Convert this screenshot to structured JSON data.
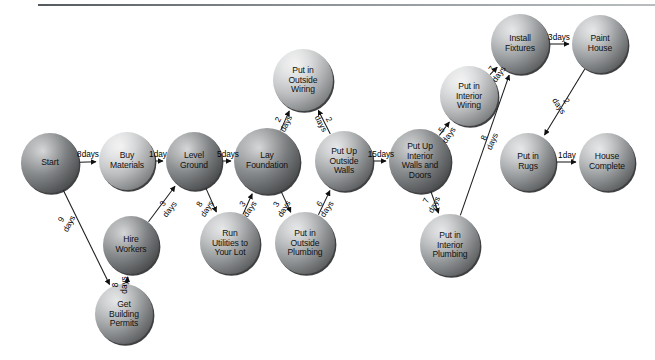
{
  "diagram": {
    "type": "directed-graph",
    "background_color": "#ffffff",
    "node_label_color": "#111111",
    "edge_color": "#1a1a1a",
    "nodes": [
      {
        "id": "start",
        "label": "Start",
        "cx": 50,
        "cy": 163,
        "rx": 29,
        "ry": 30,
        "shade": "dark"
      },
      {
        "id": "buy_materials",
        "label": "Buy\nMaterials",
        "cx": 127,
        "cy": 161,
        "rx": 28,
        "ry": 29,
        "shade": "light"
      },
      {
        "id": "level_ground",
        "label": "Level\nGround",
        "cx": 194,
        "cy": 161,
        "rx": 28,
        "ry": 29,
        "shade": "dark"
      },
      {
        "id": "lay_foundation",
        "label": "Lay\nFoundation",
        "cx": 267,
        "cy": 161,
        "rx": 33,
        "ry": 33,
        "shade": "dark"
      },
      {
        "id": "outside_wiring",
        "label": "Put in\nOutside\nWiring",
        "cx": 303,
        "cy": 80,
        "rx": 30,
        "ry": 31,
        "shade": "light"
      },
      {
        "id": "outside_walls",
        "label": "Put Up\nOutside\nWalls",
        "cx": 344,
        "cy": 161,
        "rx": 29,
        "ry": 30,
        "shade": "mid"
      },
      {
        "id": "run_utilities",
        "label": "Run\nUtilities to\nYour Lot",
        "cx": 230,
        "cy": 243,
        "rx": 30,
        "ry": 31,
        "shade": "mid"
      },
      {
        "id": "outside_plumbing",
        "label": "Put in\nOutside\nPlumbing",
        "cx": 305,
        "cy": 243,
        "rx": 30,
        "ry": 31,
        "shade": "mid"
      },
      {
        "id": "interior_walls",
        "label": "Put Up\nInterior\nWalls and\nDoors",
        "cx": 420,
        "cy": 161,
        "rx": 31,
        "ry": 32,
        "shade": "dark"
      },
      {
        "id": "interior_wiring",
        "label": "Put in\nInterior\nWiring",
        "cx": 469,
        "cy": 96,
        "rx": 29,
        "ry": 30,
        "shade": "light"
      },
      {
        "id": "interior_plumbing",
        "label": "Put in\nInterior\nPlumbing",
        "cx": 450,
        "cy": 245,
        "rx": 30,
        "ry": 31,
        "shade": "mid"
      },
      {
        "id": "install_fixtures",
        "label": "Install\nFixtures",
        "cx": 520,
        "cy": 44,
        "rx": 29,
        "ry": 30,
        "shade": "mid"
      },
      {
        "id": "paint_house",
        "label": "Paint\nHouse",
        "cx": 600,
        "cy": 44,
        "rx": 28,
        "ry": 29,
        "shade": "mid"
      },
      {
        "id": "put_in_rugs",
        "label": "Put in\nRugs",
        "cx": 528,
        "cy": 162,
        "rx": 28,
        "ry": 29,
        "shade": "mid"
      },
      {
        "id": "house_complete",
        "label": "House\nComplete",
        "cx": 607,
        "cy": 162,
        "rx": 28,
        "ry": 29,
        "shade": "mid"
      }
    ],
    "edges": [
      {
        "id": "e1",
        "from": "start",
        "to": "buy_materials",
        "days": "8",
        "unit": "days",
        "label_x": 88,
        "label_y": 155,
        "rotate": 0,
        "stacked": true
      },
      {
        "id": "e2",
        "from": "buy_materials",
        "to": "level_ground",
        "days": "1",
        "unit": "day",
        "label_x": 158,
        "label_y": 155,
        "rotate": 0,
        "stacked": true
      },
      {
        "id": "e3",
        "from": "level_ground",
        "to": "lay_foundation",
        "days": "5",
        "unit": "days",
        "label_x": 228,
        "label_y": 155,
        "rotate": 0,
        "stacked": true
      },
      {
        "id": "e4",
        "from": "start",
        "to": "get_permits",
        "days": "9",
        "unit": "days",
        "label_x": 66,
        "label_y": 222,
        "rotate": -62,
        "stacked": true
      },
      {
        "id": "e5",
        "from": "get_permits",
        "to": "hire_workers",
        "days": "8",
        "unit": "days",
        "label_x": 121,
        "label_y": 285,
        "rotate": -90,
        "stacked": true
      },
      {
        "id": "e6",
        "from": "hire_workers",
        "to": "level_ground",
        "days": "3",
        "unit": "days",
        "label_x": 167,
        "label_y": 207,
        "rotate": -52,
        "stacked": true
      },
      {
        "id": "e7",
        "from": "level_ground",
        "to": "run_utilities",
        "days": "8",
        "unit": "days",
        "label_x": 204,
        "label_y": 207,
        "rotate": -58,
        "stacked": true
      },
      {
        "id": "e8",
        "from": "run_utilities",
        "to": "lay_foundation",
        "days": "3",
        "unit": "days",
        "label_x": 247,
        "label_y": 207,
        "rotate": -56,
        "stacked": true
      },
      {
        "id": "e9",
        "from": "lay_foundation",
        "to": "outside_plumbing",
        "days": "3",
        "unit": "days",
        "label_x": 281,
        "label_y": 207,
        "rotate": -60,
        "stacked": true
      },
      {
        "id": "e10",
        "from": "outside_plumbing",
        "to": "outside_walls",
        "days": "6",
        "unit": "days",
        "label_x": 324,
        "label_y": 207,
        "rotate": -56,
        "stacked": true
      },
      {
        "id": "e11",
        "from": "lay_foundation",
        "to": "outside_wiring",
        "days": "2",
        "unit": "days",
        "label_x": 283,
        "label_y": 122,
        "rotate": -64,
        "stacked": true
      },
      {
        "id": "e12",
        "from": "outside_walls",
        "to": "outside_wiring",
        "days": "2",
        "unit": "days",
        "label_x": 324,
        "label_y": 122,
        "rotate": 62,
        "stacked": true
      },
      {
        "id": "e13",
        "from": "outside_walls",
        "to": "interior_walls",
        "days": "15",
        "unit": "days",
        "label_x": 381,
        "label_y": 155,
        "rotate": 0,
        "stacked": true
      },
      {
        "id": "e14",
        "from": "interior_walls",
        "to": "interior_wiring",
        "days": "5",
        "unit": "days",
        "label_x": 446,
        "label_y": 133,
        "rotate": -56,
        "stacked": true
      },
      {
        "id": "e15",
        "from": "interior_wiring",
        "to": "install_fixtures",
        "days": "7",
        "unit": "days",
        "label_x": 496,
        "label_y": 72,
        "rotate": -54,
        "stacked": true
      },
      {
        "id": "e16",
        "from": "interior_walls",
        "to": "interior_plumbing",
        "days": "7",
        "unit": "days",
        "label_x": 431,
        "label_y": 203,
        "rotate": -64,
        "stacked": true
      },
      {
        "id": "e17",
        "from": "interior_plumbing",
        "to": "install_fixtures",
        "days": "8",
        "unit": "days",
        "label_x": 489,
        "label_y": 140,
        "rotate": -66,
        "stacked": true
      },
      {
        "id": "e18",
        "from": "install_fixtures",
        "to": "paint_house",
        "days": "3",
        "unit": "days",
        "label_x": 559,
        "label_y": 38,
        "rotate": 0,
        "stacked": true
      },
      {
        "id": "e19",
        "from": "paint_house",
        "to": "put_in_rugs",
        "days": "2",
        "unit": "days",
        "label_x": 562,
        "label_y": 104,
        "rotate": 57,
        "stacked": true
      },
      {
        "id": "e20",
        "from": "put_in_rugs",
        "to": "house_complete",
        "days": "1",
        "unit": "day",
        "label_x": 567,
        "label_y": 156,
        "rotate": 0,
        "stacked": true
      }
    ],
    "extra_nodes": [
      {
        "id": "hire_workers",
        "label": "Hire\nWorkers",
        "cx": 131,
        "cy": 245,
        "rx": 28,
        "ry": 29,
        "shade": "dark"
      },
      {
        "id": "get_permits",
        "label": "Get\nBuilding\nPermits",
        "cx": 124,
        "cy": 314,
        "rx": 29,
        "ry": 30,
        "shade": "mid"
      }
    ]
  }
}
